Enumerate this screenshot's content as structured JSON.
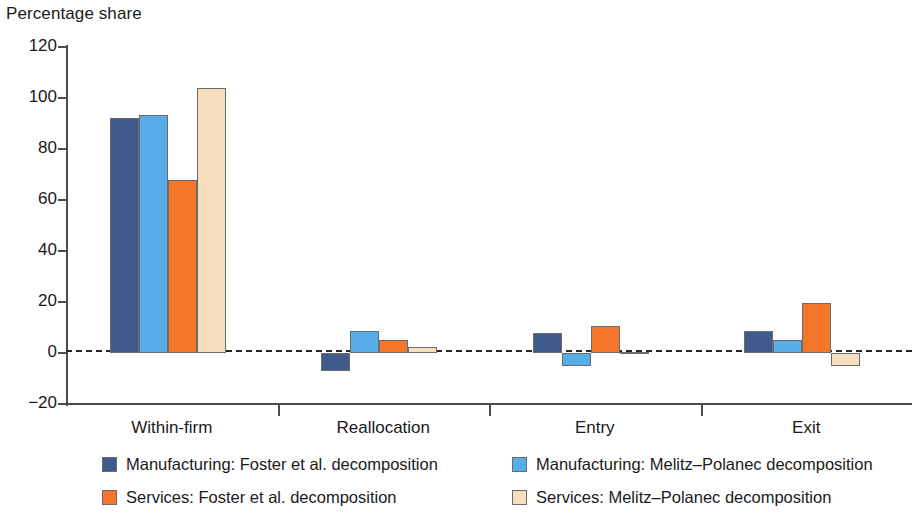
{
  "chart_data": {
    "type": "bar",
    "title": "",
    "ylabel": "Percentage share",
    "xlabel": "",
    "ylim": [
      -20,
      120
    ],
    "yticks": [
      -20,
      0,
      20,
      40,
      60,
      80,
      100,
      120
    ],
    "ytick_labels": [
      "−20",
      "0",
      "20",
      "40",
      "60",
      "80",
      "100",
      "120"
    ],
    "grid": false,
    "zero_line": true,
    "legend_position": "bottom",
    "categories": [
      "Within-firm",
      "Reallocation",
      "Entry",
      "Exit"
    ],
    "series": [
      {
        "name": "Manufacturing: Foster et al. decomposition",
        "color": "#3F5B8C",
        "values": [
          92,
          -7,
          8,
          8.5
        ]
      },
      {
        "name": "Manufacturing: Melitz–Polanec decomposition",
        "color": "#56ADE8",
        "values": [
          93.5,
          8.5,
          -5,
          5
        ]
      },
      {
        "name": "Services: Foster et al. decomposition",
        "color": "#F4762A",
        "values": [
          68,
          5,
          10.5,
          19.5
        ]
      },
      {
        "name": "Services: Melitz–Polanec decomposition",
        "color": "#F6DFBC",
        "values": [
          104,
          2.5,
          0.3,
          -5
        ]
      }
    ]
  },
  "legend": {
    "entries": [
      {
        "label": "Manufacturing: Foster et al. decomposition",
        "color": "#3F5B8C"
      },
      {
        "label": "Manufacturing: Melitz–Polanec decomposition",
        "color": "#56ADE8"
      },
      {
        "label": "Services: Foster et al. decomposition",
        "color": "#F4762A"
      },
      {
        "label": "Services: Melitz–Polanec decomposition",
        "color": "#F6DFBC"
      }
    ]
  }
}
